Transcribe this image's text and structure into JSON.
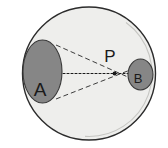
{
  "figure": {
    "background_color": "#ffffff",
    "width": 168,
    "height": 148
  },
  "shapes": {
    "outer_circle": {
      "name": "outer-circle",
      "cx": 89,
      "cy": 73.5,
      "r": 66.5,
      "fill_color": "#eeeeec",
      "stroke_color": "#2b2b2b",
      "stroke_width": 1.4
    },
    "ellipse_a": {
      "name": "ellipse-a",
      "label": "A",
      "cx": 42.5,
      "cy": 71.5,
      "rx": 19.5,
      "ry": 31.5,
      "fill_color": "#868686",
      "stroke_color": "#3a3a3a",
      "stroke_width": 1.1,
      "label_x": 40,
      "label_y": 96,
      "label_font_size": 19
    },
    "ellipse_b": {
      "name": "ellipse-b",
      "label": "B",
      "cx": 140.5,
      "cy": 74.5,
      "rx": 12.5,
      "ry": 15.5,
      "fill_color": "#868686",
      "stroke_color": "#3a3a3a",
      "stroke_width": 1.1,
      "label_x": 138,
      "label_y": 83,
      "label_font_size": 13
    },
    "point_p": {
      "name": "point-p",
      "label": "P",
      "x": 114.5,
      "y": 73.5,
      "dot_radius": 1.9,
      "dot_color": "#1a1a1a",
      "label_x": 110,
      "label_y": 62,
      "label_font_size": 17
    }
  },
  "lines": {
    "axis": {
      "name": "optical-axis",
      "x1": 27,
      "y1": 73.5,
      "x2": 152,
      "y2": 73.5,
      "stroke_color": "#1a1a1a",
      "stroke_width": 1.1,
      "dash": "2 2"
    },
    "rays": [
      {
        "name": "ray-a-top-to-b-bottom",
        "x1": 56,
        "y1": 45,
        "x2": 148,
        "y2": 86,
        "stroke_color": "#3c3c3c",
        "stroke_width": 1.0,
        "dash": "5 3"
      },
      {
        "name": "ray-a-bottom-to-b-top",
        "x1": 56,
        "y1": 99,
        "x2": 148,
        "y2": 63,
        "stroke_color": "#3c3c3c",
        "stroke_width": 1.0,
        "dash": "5 3"
      }
    ]
  },
  "labels": {
    "a": "A",
    "b": "B",
    "p": "P"
  }
}
